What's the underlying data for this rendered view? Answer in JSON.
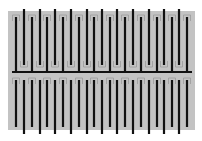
{
  "diagram": {
    "canvas": {
      "width": 202,
      "height": 141,
      "background": "#ffffff"
    },
    "substrate": {
      "x": 8,
      "y": 11,
      "width": 187,
      "height": 119,
      "color": "#c3c3c3"
    },
    "colors": {
      "line": "#111111",
      "outline": "#9a9a9a"
    },
    "line_width": 2.2,
    "middle_bar": {
      "y": 72,
      "x1": 12,
      "x2": 192
    },
    "set_a_x": [
      16,
      32,
      47,
      63,
      79,
      94,
      110,
      125,
      141,
      157,
      172,
      187
    ],
    "set_b_x": [
      24,
      40,
      55,
      71,
      87,
      102,
      117,
      133,
      149,
      164,
      179
    ],
    "top_half": {
      "set_a": {
        "y1": 17,
        "y2": 72,
        "description": "fingers connected to middle bar"
      },
      "set_b": {
        "y1": 9,
        "y2": 65,
        "description": "long fingers from top edge"
      }
    },
    "bottom_half": {
      "set_a": {
        "y1": 80,
        "y2": 127,
        "description": "short fingers"
      },
      "set_b": {
        "y1": 80,
        "y2": 134,
        "description": "long fingers to bottom edge"
      }
    }
  }
}
